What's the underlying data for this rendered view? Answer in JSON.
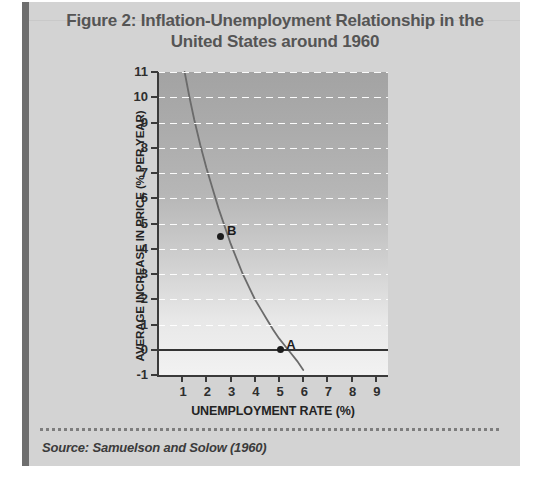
{
  "figure": {
    "title": "Figure 2: Inflation-Unemployment Relationship in the\nUnited States around 1960",
    "source": "Source: Samuelson and Solow (1960)",
    "card_bg": "#d3d3d3",
    "accent_bar_color": "#6e6e6e"
  },
  "chart_data": {
    "type": "line",
    "title": "Figure 2: Inflation-Unemployment Relationship in the United States around 1960",
    "xlabel": "UNEMPLOYMENT RATE (%)",
    "ylabel": "AVERAGE INCREASE IN PRICE (% PER YEAR)",
    "xlim": [
      0,
      9.5
    ],
    "ylim": [
      -1,
      11
    ],
    "xticks": [
      1,
      2,
      3,
      4,
      5,
      6,
      7,
      8,
      9
    ],
    "yticks": [
      -1,
      0,
      1,
      2,
      3,
      4,
      5,
      6,
      7,
      8,
      9,
      10,
      11
    ],
    "xtick_labels": [
      "1",
      "2",
      "3",
      "4",
      "5",
      "6",
      "7",
      "8",
      "9"
    ],
    "ytick_labels": [
      "-1",
      "0",
      "1",
      "2",
      "3",
      "4",
      "5",
      "6",
      "7",
      "8",
      "9",
      "10",
      "11"
    ],
    "grid": "horizontal-dashed-white",
    "legend": "none",
    "zero_line": true,
    "series": [
      {
        "name": "Phillips curve",
        "color": "#6b6b6b",
        "x": [
          1.1,
          1.3,
          1.5,
          1.75,
          2.0,
          2.25,
          2.5,
          2.75,
          3.0,
          3.25,
          3.5,
          3.75,
          4.0,
          4.25,
          4.5,
          4.75,
          5.0,
          5.25,
          5.5,
          5.75,
          6.0
        ],
        "y": [
          11.0,
          10.0,
          9.1,
          8.1,
          7.2,
          6.4,
          5.6,
          4.9,
          4.2,
          3.6,
          3.0,
          2.5,
          2.0,
          1.6,
          1.2,
          0.8,
          0.45,
          0.15,
          -0.15,
          -0.45,
          -0.8
        ]
      }
    ],
    "annotations": [
      {
        "label": "A",
        "x": 5.05,
        "y": 0.0
      },
      {
        "label": "B",
        "x": 2.6,
        "y": 4.5
      }
    ],
    "plot_bg_gradient": [
      "#a3a3a3",
      "#f2f2f2"
    ]
  }
}
